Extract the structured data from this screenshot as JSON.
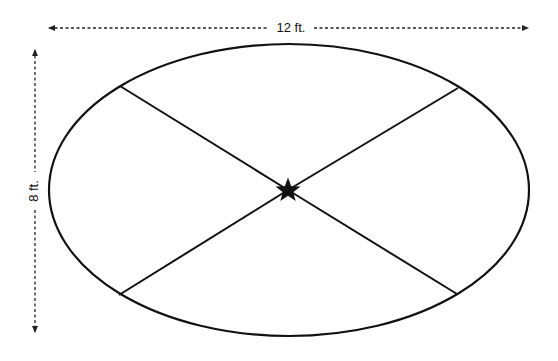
{
  "diagram": {
    "width_label": "12 ft.",
    "height_label": "8 ft.",
    "shape": "ellipse",
    "center_marker": "star-icon",
    "colors": {
      "stroke": "#111111",
      "dimension_line": "#222222",
      "background": "#ffffff"
    },
    "geometry": {
      "ellipse": {
        "cx": 289,
        "cy": 190,
        "rx": 240,
        "ry": 146
      },
      "center": {
        "x": 288,
        "y": 190
      },
      "spoke_endpoints": [
        {
          "name": "top-left",
          "x": 120,
          "y": 86
        },
        {
          "name": "top-right",
          "x": 458,
          "y": 88
        },
        {
          "name": "bottom-left",
          "x": 119,
          "y": 295
        },
        {
          "name": "bottom-right",
          "x": 457,
          "y": 294
        }
      ],
      "horizontal_dimension": {
        "x1": 49,
        "x2": 528,
        "y": 28
      },
      "vertical_dimension": {
        "x": 35,
        "y1": 50,
        "y2": 332
      }
    }
  }
}
